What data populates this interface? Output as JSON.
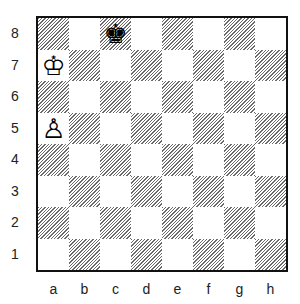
{
  "diagram": {
    "type": "chess-position",
    "ranks": [
      "8",
      "7",
      "6",
      "5",
      "4",
      "3",
      "2",
      "1"
    ],
    "files": [
      "a",
      "b",
      "c",
      "d",
      "e",
      "f",
      "g",
      "h"
    ],
    "colors": {
      "light_square": "#ffffff",
      "dark_square_hatch": "#6a6a6a",
      "border": "#111111"
    },
    "pieces": [
      {
        "square": "c8",
        "color": "black",
        "type": "king",
        "glyph": "♚"
      },
      {
        "square": "a7",
        "color": "white",
        "type": "king",
        "glyph": "♔"
      },
      {
        "square": "a5",
        "color": "white",
        "type": "pawn",
        "glyph": "♙"
      }
    ]
  }
}
